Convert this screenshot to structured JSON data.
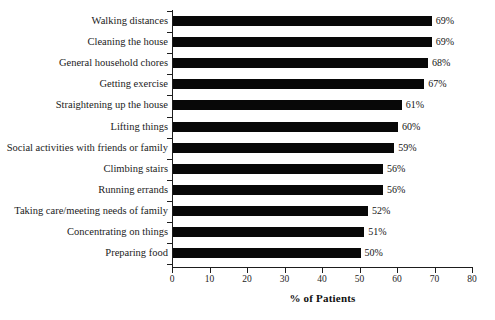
{
  "chart_data": {
    "type": "bar",
    "orientation": "horizontal",
    "title": "",
    "subtitle": "",
    "xlabel": "% of Patients",
    "ylabel": "",
    "xlim": [
      0,
      80
    ],
    "xticks": [
      0,
      10,
      20,
      30,
      40,
      50,
      60,
      70,
      80
    ],
    "xtick_labels": [
      "0",
      "10",
      "20",
      "30",
      "40",
      "50",
      "60",
      "70",
      "80"
    ],
    "grid": false,
    "legend": null,
    "bar_color": "#080808",
    "axis_color": "#1d1d1d",
    "background_color": "#ffffff",
    "value_label_suffix": "%",
    "categories": [
      "Walking distances",
      "Cleaning the house",
      "General household chores",
      "Getting exercise",
      "Straightening up the house",
      "Lifting things",
      "Social activities with friends or family",
      "Climbing stairs",
      "Running errands",
      "Taking care/meeting needs of family",
      "Concentrating on things",
      "Preparing food"
    ],
    "values": [
      69,
      69,
      68,
      67,
      61,
      60,
      59,
      56,
      56,
      52,
      51,
      50
    ],
    "value_labels": [
      "69%",
      "69%",
      "68%",
      "67%",
      "61%",
      "60%",
      "59%",
      "56%",
      "56%",
      "52%",
      "51%",
      "50%"
    ]
  }
}
